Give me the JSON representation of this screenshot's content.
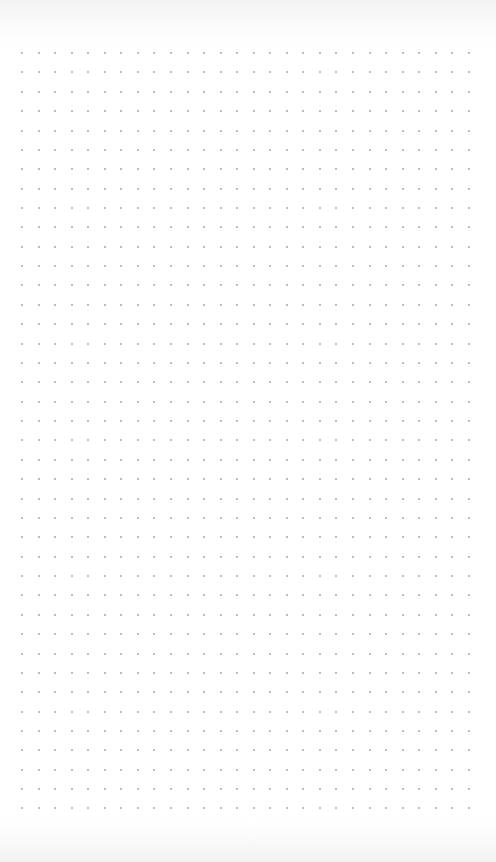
{
  "page": {
    "type": "dot-grid-paper",
    "background_color": "#ffffff",
    "dot_color": "#a9a9a9"
  },
  "grid": {
    "columns": 28,
    "rows": 40,
    "origin_x": 22,
    "origin_y": 53,
    "spacing_x": 16.55,
    "spacing_y": 19.37
  }
}
